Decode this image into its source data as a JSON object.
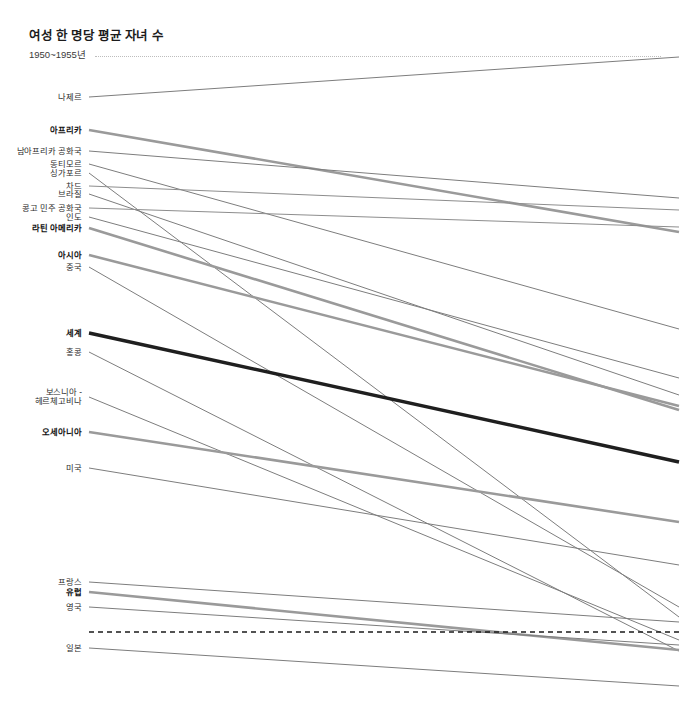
{
  "header": {
    "title": "여성 한 명당 평균 자녀 수",
    "subtitle": "1950~1955년"
  },
  "chart_data": {
    "type": "line",
    "subtype": "slopegraph",
    "title": "여성 한 명당 평균 자녀 수",
    "subtitle": "1950~1955년",
    "xlabel": "",
    "ylabel": "여성 한 명당 평균 자녀 수",
    "x": [
      "1950~1955년",
      "2010~2015년"
    ],
    "grid": false,
    "legend": "none",
    "reference_line": {
      "label": "",
      "value": 2.1,
      "style": "dashed",
      "color": "#1a1a1a"
    },
    "ylim": [
      0.9,
      7.8
    ],
    "series": [
      {
        "name": "니제르",
        "label": "나제르",
        "values": [
          6.86,
          7.6
        ],
        "emphasis": "none",
        "color": "#7d7d7d",
        "width": 1.0
      },
      {
        "name": "아프리카",
        "label": "아프리카",
        "values": [
          6.6,
          4.72
        ],
        "emphasis": "bold",
        "color": "#9a9a9a",
        "width": 2.6
      },
      {
        "name": "남아프리카 공화국",
        "label": "남아프리카 공화국",
        "values": [
          6.26,
          5.4
        ],
        "emphasis": "none",
        "color": "#7d7d7d",
        "width": 1.0
      },
      {
        "name": "동티모르",
        "label": "동티모르",
        "values": [
          6.1,
          3.1
        ],
        "emphasis": "none",
        "color": "#7d7d7d",
        "width": 1.0
      },
      {
        "name": "싱가포르",
        "label": "싱가포르",
        "values": [
          6.02,
          1.52
        ],
        "emphasis": "none",
        "color": "#7d7d7d",
        "width": 1.0
      },
      {
        "name": "차드",
        "label": "차드",
        "values": [
          5.9,
          5.46
        ],
        "emphasis": "none",
        "color": "#8d8d8d",
        "width": 1.0
      },
      {
        "name": "브라질",
        "label": "브라질",
        "values": [
          5.82,
          2.4
        ],
        "emphasis": "none",
        "color": "#7d7d7d",
        "width": 1.0
      },
      {
        "name": "콩고 민주 공화국",
        "label": "콩고 민주 공화국",
        "values": [
          5.7,
          5.36
        ],
        "emphasis": "none",
        "color": "#8d8d8d",
        "width": 1.0
      },
      {
        "name": "인도",
        "label": "인도",
        "values": [
          5.62,
          2.7
        ],
        "emphasis": "none",
        "color": "#7d7d7d",
        "width": 1.0
      },
      {
        "name": "라틴 아메리카",
        "label": "라틴 아메리카",
        "values": [
          5.52,
          2.22
        ],
        "emphasis": "bold",
        "color": "#9a9a9a",
        "width": 2.6
      },
      {
        "name": "아시아",
        "label": "아시아",
        "values": [
          5.26,
          2.26
        ],
        "emphasis": "bold",
        "color": "#9a9a9a",
        "width": 2.6
      },
      {
        "name": "중국",
        "label": "중국",
        "values": [
          5.15,
          1.6
        ],
        "emphasis": "none",
        "color": "#7d7d7d",
        "width": 1.0
      },
      {
        "name": "세계",
        "label": "세계",
        "values": [
          4.6,
          2.56
        ],
        "emphasis": "strong",
        "color": "#1f1f1f",
        "width": 3.4
      },
      {
        "name": "홍콩",
        "label": "홍콩",
        "values": [
          4.44,
          1.2
        ],
        "emphasis": "none",
        "color": "#7d7d7d",
        "width": 1.0
      },
      {
        "name": "보스니아 - 헤르체고비나",
        "label": "보스니아 -\n헤르체고비나",
        "values": [
          4.06,
          1.3
        ],
        "emphasis": "none",
        "color": "#7d7d7d",
        "width": 1.0
      },
      {
        "name": "오세아니아",
        "label": "오세아니아",
        "values": [
          3.76,
          2.4
        ],
        "emphasis": "bold",
        "color": "#9a9a9a",
        "width": 2.6
      },
      {
        "name": "미국",
        "label": "미국",
        "values": [
          3.46,
          1.88
        ],
        "emphasis": "none",
        "color": "#7d7d7d",
        "width": 1.0
      },
      {
        "name": "프랑스",
        "label": "프랑스",
        "values": [
          2.72,
          2.0
        ],
        "emphasis": "none",
        "color": "#7d7d7d",
        "width": 1.0
      },
      {
        "name": "유럽",
        "label": "유럽",
        "values": [
          2.64,
          1.58
        ],
        "emphasis": "bold",
        "color": "#9a9a9a",
        "width": 2.6
      },
      {
        "name": "영국",
        "label": "영국",
        "values": [
          2.5,
          1.88
        ],
        "emphasis": "none",
        "color": "#7d7d7d",
        "width": 1.0
      },
      {
        "name": "일본",
        "label": "일본",
        "values": [
          2.12,
          1.42
        ],
        "emphasis": "none",
        "color": "#7d7d7d",
        "width": 1.0
      }
    ]
  },
  "_layout": {
    "plot_left": 89,
    "plot_right": 679,
    "label_right": 82,
    "rows": [
      {
        "name": "니제르",
        "y0": 97,
        "y1": 57
      },
      {
        "name": "아프리카",
        "y0": 130,
        "y1": 232
      },
      {
        "name": "남아프리카 공화국",
        "y0": 151,
        "y1": 198
      },
      {
        "name": "동티모르",
        "y0": 164,
        "y1": 329
      },
      {
        "name": "싱가포르",
        "y0": 173,
        "y1": 617
      },
      {
        "name": "차드",
        "y0": 186,
        "y1": 210
      },
      {
        "name": "브라질",
        "y0": 194,
        "y1": 395
      },
      {
        "name": "콩고 민주 공화국",
        "y0": 208,
        "y1": 227
      },
      {
        "name": "인도",
        "y0": 217,
        "y1": 378
      },
      {
        "name": "라틴 아메리카",
        "y0": 228,
        "y1": 410
      },
      {
        "name": "아시아",
        "y0": 255,
        "y1": 406
      },
      {
        "name": "중국",
        "y0": 267,
        "y1": 607
      },
      {
        "name": "세계",
        "y0": 333,
        "y1": 462
      },
      {
        "name": "홍콩",
        "y0": 352,
        "y1": 651
      },
      {
        "name": "보스니아 - 헤르체고비나",
        "y0": 397,
        "y1": 640
      },
      {
        "name": "오세아니아",
        "y0": 432,
        "y1": 522
      },
      {
        "name": "미국",
        "y0": 468,
        "y1": 565
      },
      {
        "name": "프랑스",
        "y0": 582,
        "y1": 622
      },
      {
        "name": "유럽",
        "y0": 592,
        "y1": 650
      },
      {
        "name": "영국",
        "y0": 607,
        "y1": 645
      },
      {
        "name": "일본",
        "y0": 648,
        "y1": 686
      }
    ],
    "reference_line_y": 632
  }
}
